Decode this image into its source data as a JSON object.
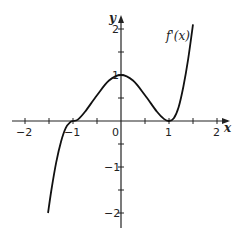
{
  "chart_data": {
    "type": "line",
    "title": "",
    "xlabel": "x",
    "ylabel": "y",
    "xlim": [
      -2.2,
      2.2
    ],
    "ylim": [
      -2.2,
      2.2
    ],
    "grid": false,
    "x_ticks": [
      -2,
      -1.5,
      -1,
      -0.5,
      0,
      0.5,
      1,
      1.5,
      2
    ],
    "x_tick_labels": [
      "−2",
      "",
      "−1",
      "",
      "0",
      "",
      "1",
      "",
      "2"
    ],
    "y_ticks": [
      -2,
      -1.5,
      -1,
      -0.5,
      0.5,
      1,
      1.5,
      2
    ],
    "y_tick_labels": [
      "−2",
      "",
      "−1",
      "",
      "",
      "1",
      "",
      "2"
    ],
    "series": [
      {
        "name": "f'(x)",
        "x": [
          -1.52,
          -1.45,
          -1.35,
          -1.25,
          -1.15,
          -1.05,
          -1.0,
          -0.9,
          -0.75,
          -0.5,
          -0.25,
          0,
          0.25,
          0.5,
          0.75,
          0.9,
          1.0,
          1.1,
          1.2,
          1.3,
          1.4,
          1.5
        ],
        "values": [
          -2.0,
          -1.5,
          -0.9,
          -0.45,
          -0.15,
          -0.02,
          0,
          0.03,
          0.2,
          0.56,
          0.88,
          1.0,
          0.88,
          0.56,
          0.2,
          0.04,
          0,
          0.06,
          0.3,
          0.75,
          1.35,
          2.1
        ]
      }
    ],
    "annotations": [
      {
        "text": "f'(x)",
        "x": 1.12,
        "y": 1.75
      }
    ]
  },
  "labels": {
    "x_axis": "x",
    "y_axis": "y",
    "function": "f'(x)",
    "origin": "0"
  }
}
